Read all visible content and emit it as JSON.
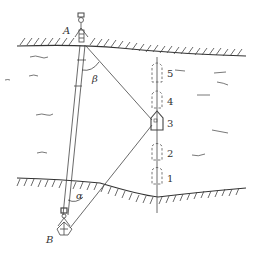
{
  "figure": {
    "stations": [
      {
        "id": "A",
        "label": "A"
      },
      {
        "id": "B",
        "label": "B"
      }
    ],
    "angles": [
      {
        "id": "beta",
        "label": "β"
      },
      {
        "id": "alpha",
        "label": "α"
      }
    ],
    "boat_positions": [
      {
        "label": "1",
        "style": "dashed"
      },
      {
        "label": "2",
        "style": "dashed"
      },
      {
        "label": "3",
        "style": "solid"
      },
      {
        "label": "4",
        "style": "dashed"
      },
      {
        "label": "5",
        "style": "dashed"
      }
    ],
    "colors": {
      "line": "#444444",
      "background": "#ffffff"
    }
  }
}
